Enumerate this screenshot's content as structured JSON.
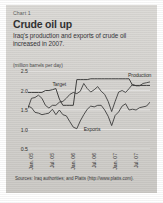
{
  "panel": {
    "chart_number": "Chart 1",
    "title": "Crude oil up",
    "subtitle": "Iraq's production and exports of crude oil increased in 2007.",
    "units": "(million barrels per day)",
    "source": "Sources: Iraq authorities; and Platts (http://www.platts.com).",
    "panel_color": "#d8d6d2",
    "line_color": "#2b2b2a",
    "grid_color": "#f2f1ee"
  },
  "chart_data": {
    "type": "line",
    "title": "Crude oil up",
    "subtitle": "Iraq's production and exports of crude oil increased in 2007.",
    "xlabel": "",
    "ylabel": "(million barrels per day)",
    "ylim": [
      0.5,
      2.5
    ],
    "yticks": [
      2.5,
      2.0,
      1.5,
      1.0,
      0.5
    ],
    "ytick_labels": [
      "2.5",
      "2.0",
      "1.5",
      "1.0",
      "0.5"
    ],
    "grid": true,
    "legend": "inline-annotations",
    "x": [
      "Jan. 05",
      "Feb. 05",
      "Mar. 05",
      "Apr. 05",
      "May 05",
      "Jun. 05",
      "Jul. 05",
      "Aug. 05",
      "Sep. 05",
      "Oct. 05",
      "Nov. 05",
      "Dec. 05",
      "Jan. 06",
      "Feb. 06",
      "Mar. 06",
      "Apr. 06",
      "May 06",
      "Jun. 06",
      "Jul. 06",
      "Aug. 06",
      "Sep. 06",
      "Oct. 06",
      "Nov. 06",
      "Dec. 06",
      "Jan. 07",
      "Feb. 07",
      "Mar. 07",
      "Apr. 07",
      "May 07",
      "Jun. 07",
      "Jul. 07",
      "Aug. 07",
      "Sep. 07",
      "Oct. 07",
      "Nov. 07",
      "Dec. 07"
    ],
    "xticks": [
      "Jan. 05",
      "Jul. 05",
      "Jan. 06",
      "Jul. 06",
      "Jan. 07",
      "Jul. 07"
    ],
    "xtick_indices": [
      0,
      6,
      12,
      18,
      24,
      30
    ],
    "series": [
      {
        "name": "Target",
        "values": [
          1.95,
          1.95,
          1.95,
          1.95,
          1.95,
          2.0,
          2.0,
          2.02,
          2.05,
          1.78,
          1.62,
          1.62,
          1.62,
          1.62,
          2.28,
          2.28,
          2.28,
          2.28,
          2.3,
          2.3,
          2.3,
          2.3,
          2.3,
          2.3,
          2.3,
          2.3,
          2.3,
          2.3,
          2.3,
          2.3,
          2.13,
          2.13,
          2.13,
          2.13,
          2.13,
          2.13
        ],
        "label_x_index": 7,
        "label_y": 2.18
      },
      {
        "name": "Production",
        "values": [
          1.55,
          1.8,
          1.82,
          1.88,
          1.8,
          1.62,
          1.55,
          1.62,
          1.62,
          1.7,
          1.72,
          1.8,
          1.9,
          1.95,
          1.92,
          1.98,
          2.18,
          2.05,
          1.96,
          2.02,
          2.1,
          1.98,
          1.9,
          1.72,
          1.46,
          1.72,
          1.96,
          2.0,
          1.95,
          2.05,
          2.16,
          2.12,
          2.12,
          2.18,
          2.2,
          2.22
        ],
        "label_x_index": 29,
        "label_y": 2.4
      },
      {
        "name": "Exports",
        "values": [
          1.6,
          1.56,
          1.44,
          1.42,
          1.38,
          1.4,
          1.42,
          1.52,
          1.38,
          1.5,
          1.38,
          1.35,
          1.2,
          1.06,
          1.02,
          1.22,
          1.38,
          1.52,
          1.6,
          1.58,
          1.62,
          1.62,
          1.5,
          1.34,
          1.1,
          1.36,
          1.45,
          1.6,
          1.66,
          1.5,
          1.52,
          1.5,
          1.56,
          1.58,
          1.6,
          1.7
        ],
        "label_x_index": 16,
        "label_y": 1.02
      }
    ]
  }
}
